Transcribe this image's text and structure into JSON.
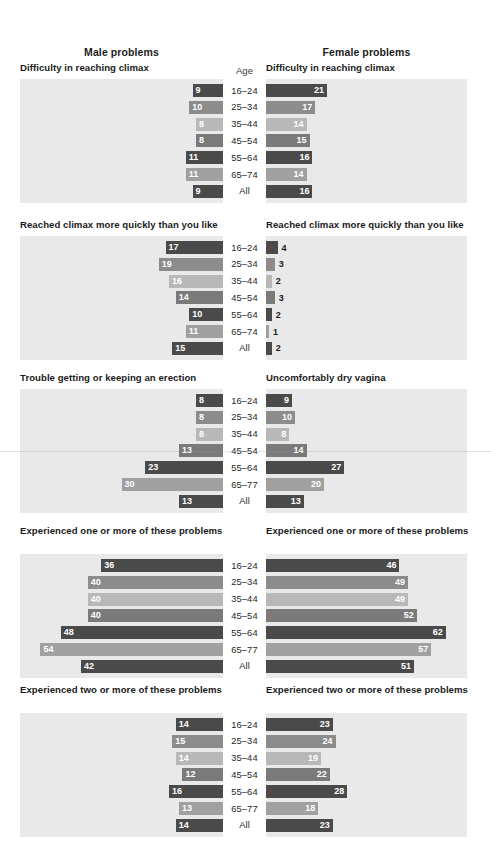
{
  "header": {
    "male_label": "Male problems",
    "female_label": "Female problems",
    "age_column_label": "Age"
  },
  "shades": {
    "dark": "#4a4a4a",
    "medium": "#8c8c8c",
    "light": "#b8b8b8",
    "medium_dark": "#7a7a7a",
    "medium_light": "#a0a0a0",
    "panel_bg": "#e9e9e9",
    "page_bg": "#ffffff",
    "text": "#1a1a1a",
    "bar_label_light": "#ffffff"
  },
  "chart_data": {
    "type": "bar",
    "xlabel": "",
    "ylabel": "Age",
    "orientation": "horizontal-diverging",
    "grid": false,
    "legend": "none",
    "categories": [
      "16–24",
      "25–34",
      "35–44",
      "45–54",
      "55–64",
      "65–74",
      "All"
    ],
    "panels": [
      {
        "male_title": "Difficulty in reaching climax",
        "female_title": "Difficulty in reaching climax",
        "age_labels": [
          "16–24",
          "25–34",
          "35–44",
          "45–54",
          "55–64",
          "65–74",
          "All"
        ],
        "male_values": [
          9,
          10,
          8,
          8,
          11,
          11,
          9
        ],
        "female_values": [
          21,
          17,
          14,
          15,
          16,
          14,
          16
        ]
      },
      {
        "male_title": "Reached climax more quickly than you like",
        "female_title": "Reached climax more quickly than you like",
        "age_labels": [
          "16–24",
          "25–34",
          "35–44",
          "45–54",
          "55–64",
          "65–74",
          "All"
        ],
        "male_values": [
          17,
          19,
          16,
          14,
          10,
          11,
          15
        ],
        "female_values": [
          4,
          3,
          2,
          3,
          2,
          1,
          2
        ]
      },
      {
        "male_title": "Trouble getting or keeping an erection",
        "female_title": "Uncomfortably dry vagina",
        "age_labels": [
          "16–24",
          "25–34",
          "35–44",
          "45–54",
          "55–64",
          "65–77",
          "All"
        ],
        "male_values": [
          8,
          8,
          8,
          13,
          23,
          30,
          13
        ],
        "female_values": [
          9,
          10,
          8,
          14,
          27,
          20,
          13
        ]
      },
      {
        "male_title": "Experienced one or more of these problems",
        "female_title": "Experienced one or more of these problems",
        "age_labels": [
          "16–24",
          "25–34",
          "35–44",
          "45–54",
          "55–64",
          "65–77",
          "All"
        ],
        "male_values": [
          36,
          40,
          40,
          40,
          48,
          54,
          42
        ],
        "female_values": [
          46,
          49,
          49,
          52,
          62,
          57,
          51
        ]
      },
      {
        "male_title": "Experienced two or more of these problems",
        "female_title": "Experienced two or more of these problems",
        "age_labels": [
          "16–24",
          "25–34",
          "35–44",
          "45–54",
          "55–64",
          "65–77",
          "All"
        ],
        "male_values": [
          14,
          15,
          14,
          12,
          16,
          13,
          14
        ],
        "female_values": [
          23,
          24,
          19,
          22,
          28,
          18,
          23
        ]
      }
    ]
  }
}
